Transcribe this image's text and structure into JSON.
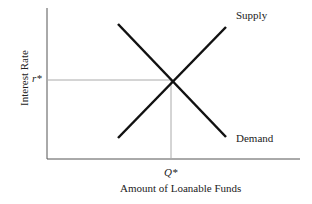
{
  "diagram": {
    "type": "supply-demand",
    "y_axis_label": "Interest Rate",
    "x_axis_label": "Amount of Loanable Funds",
    "equilibrium_rate_label": "r*",
    "equilibrium_quantity_label": "Q*",
    "curves": [
      {
        "name": "Supply",
        "label": "Supply",
        "from": [
          118,
          138
        ],
        "to": [
          226,
          27
        ]
      },
      {
        "name": "Demand",
        "label": "Demand",
        "from": [
          118,
          24
        ],
        "to": [
          226,
          137
        ]
      }
    ],
    "equilibrium_point": [
      171,
      80
    ],
    "colors": {
      "curve": "#111111",
      "axis": "#555555",
      "guide": "#aaaaaa"
    }
  }
}
